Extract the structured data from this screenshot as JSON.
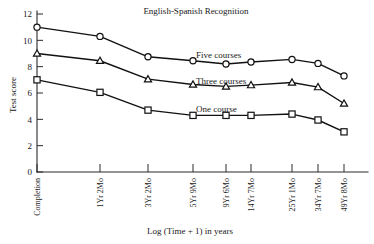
{
  "chart_data": {
    "type": "line",
    "title": "English-Spanish Recognition",
    "xlabel": "Log (Time + 1) in years",
    "ylabel": "Test score",
    "categories": [
      "Completion",
      "1Yr 2Mo",
      "3Yr 2Mo",
      "5Yr 9Mo",
      "9Yr 6Mo",
      "14Yr 7Mo",
      "25Yr 1Mo",
      "34Yr 7Mo",
      "49Yr 8Mo"
    ],
    "x_positions": [
      37,
      100,
      148,
      193,
      226,
      251,
      292,
      318,
      344
    ],
    "ylim": [
      0,
      12
    ],
    "yticks": [
      0,
      2,
      4,
      6,
      8,
      10,
      12
    ],
    "grid": false,
    "legend": "inline-annotations",
    "series": [
      {
        "name": "Five courses",
        "marker": "circle",
        "values": [
          11.0,
          10.3,
          8.75,
          8.45,
          8.2,
          8.35,
          8.55,
          8.25,
          7.3
        ],
        "label_x": 196,
        "label_y": 58
      },
      {
        "name": "Three courses",
        "marker": "triangle",
        "values": [
          9.0,
          8.45,
          7.05,
          6.65,
          6.5,
          6.6,
          6.8,
          6.45,
          5.2
        ],
        "label_x": 196,
        "label_y": 84
      },
      {
        "name": "One course",
        "marker": "square",
        "values": [
          7.0,
          6.05,
          4.7,
          4.3,
          4.3,
          4.3,
          4.4,
          3.95,
          3.05
        ],
        "label_x": 196,
        "label_y": 112
      }
    ]
  },
  "figure": {
    "title_x": 196,
    "title_y": 14
  }
}
